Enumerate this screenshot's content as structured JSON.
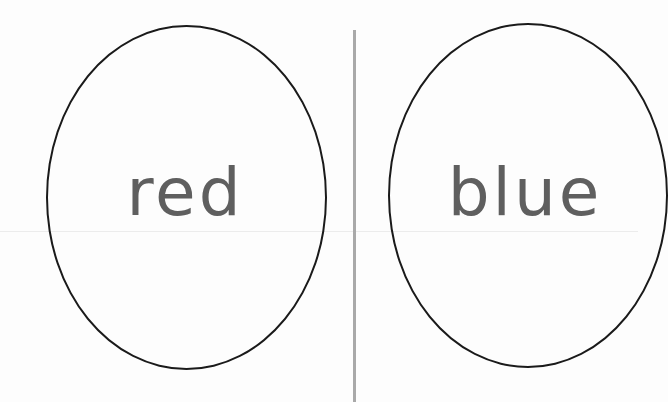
{
  "cards": {
    "left": {
      "word": "red"
    },
    "right": {
      "word": "blue"
    }
  },
  "colors": {
    "background": "#fdfdfd",
    "oval_stroke": "#1a1a1a",
    "word_text": "#5f5f5f",
    "divider": "#a9a9a9"
  }
}
